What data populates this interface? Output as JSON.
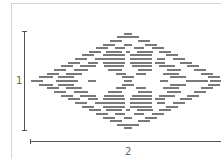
{
  "diagram": {
    "labels": {
      "height": "1",
      "width": "2"
    },
    "colors": {
      "bar": "#7a7a7a",
      "dimension_line": "#555555",
      "frame": "#d4d4d4"
    },
    "motif": {
      "center_x": 128,
      "center_y": 81,
      "row_spacing": 3.65,
      "rows_top_half": [
        [
          [
            124,
            8
          ]
        ],
        [
          [
            117,
            22
          ]
        ],
        [
          [
            110,
            12
          ],
          [
            138,
            12
          ]
        ],
        [
          [
            103,
            12
          ],
          [
            124,
            8
          ],
          [
            145,
            12
          ]
        ],
        [
          [
            96,
            12
          ],
          [
            115,
            10
          ],
          [
            134,
            10
          ],
          [
            152,
            12
          ]
        ],
        [
          [
            89,
            12
          ],
          [
            106,
            16
          ],
          [
            126,
            4
          ],
          [
            137,
            16
          ],
          [
            159,
            12
          ]
        ],
        [
          [
            82,
            12
          ],
          [
            103,
            22
          ],
          [
            130,
            22
          ],
          [
            166,
            12
          ]
        ],
        [
          [
            75,
            12
          ],
          [
            95,
            8
          ],
          [
            103,
            22
          ],
          [
            130,
            22
          ],
          [
            157,
            8
          ],
          [
            173,
            12
          ]
        ],
        [
          [
            68,
            12
          ],
          [
            88,
            10
          ],
          [
            103,
            22
          ],
          [
            130,
            22
          ],
          [
            155,
            10
          ],
          [
            180,
            12
          ]
        ],
        [
          [
            61,
            12
          ],
          [
            80,
            16
          ],
          [
            104,
            20
          ],
          [
            132,
            20
          ],
          [
            159,
            16
          ],
          [
            187,
            12
          ]
        ],
        [
          [
            54,
            12
          ],
          [
            74,
            14
          ],
          [
            108,
            14
          ],
          [
            138,
            14
          ],
          [
            167,
            14
          ],
          [
            194,
            12
          ]
        ],
        [
          [
            47,
            12
          ],
          [
            66,
            16
          ],
          [
            116,
            10
          ],
          [
            136,
            10
          ],
          [
            163,
            16
          ],
          [
            201,
            12
          ]
        ],
        [
          [
            39,
            14
          ],
          [
            58,
            16
          ],
          [
            122,
            12
          ],
          [
            170,
            16
          ],
          [
            208,
            12
          ]
        ],
        [
          [
            31,
            12
          ],
          [
            56,
            22
          ],
          [
            88,
            8
          ],
          [
            124,
            8
          ],
          [
            160,
            8
          ],
          [
            186,
            22
          ],
          [
            210,
            11
          ]
        ]
      ]
    }
  }
}
